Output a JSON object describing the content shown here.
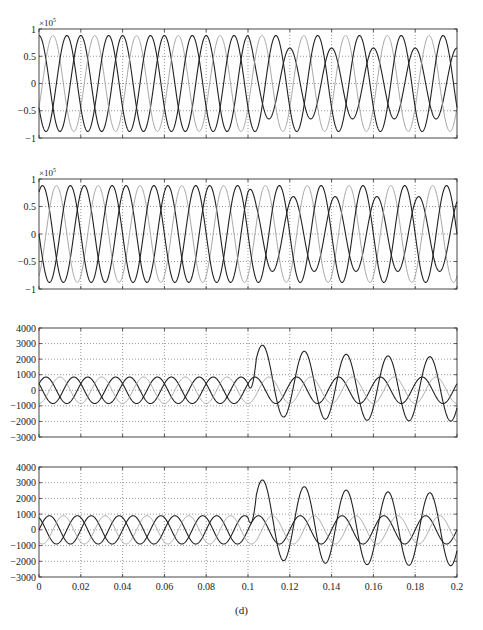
{
  "figure": {
    "caption": "(d)"
  },
  "chart_data": [
    {
      "type": "line",
      "panel": 1,
      "title": "",
      "xlabel": "",
      "ylabel": "",
      "y_multiplier": "×10^5",
      "xlim": [
        0,
        0.2
      ],
      "ylim": [
        -1,
        1
      ],
      "yticks": [
        -1,
        -0.5,
        0,
        0.5,
        1
      ],
      "ytick_labels": [
        "-1",
        "-0.5",
        "0",
        "0.5",
        "1"
      ],
      "xticks": [
        0,
        0.02,
        0.04,
        0.06,
        0.08,
        0.1,
        0.12,
        0.14,
        0.16,
        0.18,
        0.2
      ],
      "xtick_labels_shown": false,
      "grid": true,
      "description": "Three-phase sinusoidal voltages (50 Hz), amplitude ~0.88e5; after t=0.1 the dark phase amplitude drops to ~0.65e5 (fault)",
      "series": [
        {
          "name": "phase A",
          "amplitude_pre": 0.88,
          "amplitude_post": 0.65,
          "phase_deg": 90,
          "style": "dark"
        },
        {
          "name": "phase B",
          "amplitude_pre": 0.88,
          "amplitude_post": 0.88,
          "phase_deg": -30,
          "style": "gray"
        },
        {
          "name": "phase C",
          "amplitude_pre": 0.88,
          "amplitude_post": 0.88,
          "phase_deg": 210,
          "style": "dark"
        }
      ],
      "frequency_hz": 50,
      "event_time": 0.1
    },
    {
      "type": "line",
      "panel": 2,
      "title": "",
      "xlabel": "",
      "ylabel": "",
      "y_multiplier": "×10^5",
      "xlim": [
        0,
        0.2
      ],
      "ylim": [
        -1,
        1
      ],
      "yticks": [
        -1,
        -0.5,
        0,
        0.5,
        1
      ],
      "ytick_labels": [
        "-1",
        "-0.5",
        "0",
        "0.5",
        "1"
      ],
      "xticks": [
        0,
        0.02,
        0.04,
        0.06,
        0.08,
        0.1,
        0.12,
        0.14,
        0.16,
        0.18,
        0.2
      ],
      "xtick_labels_shown": false,
      "grid": true,
      "description": "Three-phase sinusoidal voltages (50 Hz), amplitude ~0.88e5; after t=0.1 the dark phase amplitude drops to ~0.68e5",
      "series": [
        {
          "name": "phase A",
          "amplitude_pre": 0.88,
          "amplitude_post": 0.68,
          "phase_deg": 60,
          "style": "dark"
        },
        {
          "name": "phase B",
          "amplitude_pre": 0.88,
          "amplitude_post": 0.88,
          "phase_deg": -60,
          "style": "gray"
        },
        {
          "name": "phase C",
          "amplitude_pre": 0.88,
          "amplitude_post": 0.88,
          "phase_deg": 180,
          "style": "dark"
        }
      ],
      "frequency_hz": 50,
      "event_time": 0.1
    },
    {
      "type": "line",
      "panel": 3,
      "title": "",
      "xlabel": "",
      "ylabel": "",
      "xlim": [
        0,
        0.2
      ],
      "ylim": [
        -3000,
        4000
      ],
      "yticks": [
        -3000,
        -2000,
        -1000,
        0,
        1000,
        2000,
        3000,
        4000
      ],
      "ytick_labels": [
        "-3000",
        "-2000",
        "-1000",
        "0",
        "1000",
        "2000",
        "3000",
        "4000"
      ],
      "xticks": [
        0,
        0.02,
        0.04,
        0.06,
        0.08,
        0.1,
        0.12,
        0.14,
        0.16,
        0.18,
        0.2
      ],
      "xtick_labels_shown": false,
      "grid": true,
      "description": "Three-phase currents amplitude ~850; after t=0.1 the faulted phase rises with DC offset: peaks ~3100, 2400, 2200, 2100, 2100; troughs ~-1500, -1900, -2000, -2000",
      "series": [
        {
          "name": "phase A (faulted)",
          "amplitude_pre": 850,
          "phase_deg": 150,
          "style": "dark",
          "post_peaks": [
            [
              0.107,
              3100
            ],
            [
              0.127,
              2400
            ],
            [
              0.147,
              2200
            ],
            [
              0.167,
              2150
            ],
            [
              0.187,
              2100
            ]
          ],
          "post_troughs": [
            [
              0.117,
              -1500
            ],
            [
              0.137,
              -1900
            ],
            [
              0.157,
              -2000
            ],
            [
              0.177,
              -2000
            ],
            [
              0.197,
              -2000
            ]
          ]
        },
        {
          "name": "phase B",
          "amplitude_pre": 850,
          "phase_deg": 30,
          "style": "dark"
        },
        {
          "name": "phase C",
          "amplitude_pre": 850,
          "phase_deg": -90,
          "style": "gray"
        }
      ],
      "frequency_hz": 50,
      "event_time": 0.1
    },
    {
      "type": "line",
      "panel": 4,
      "title": "",
      "xlabel": "",
      "ylabel": "",
      "xlim": [
        0,
        0.2
      ],
      "ylim": [
        -3000,
        4000
      ],
      "yticks": [
        -3000,
        -2000,
        -1000,
        0,
        1000,
        2000,
        3000,
        4000
      ],
      "ytick_labels": [
        "-3000",
        "-2000",
        "-1000",
        "0",
        "1000",
        "2000",
        "3000",
        "4000"
      ],
      "xticks": [
        0,
        0.02,
        0.04,
        0.06,
        0.08,
        0.1,
        0.12,
        0.14,
        0.16,
        0.18,
        0.2
      ],
      "xtick_labels": [
        "0",
        "0.02",
        "0.04",
        "0.06",
        "0.08",
        "0.1",
        "0.12",
        "0.14",
        "0.16",
        "0.18",
        "0.2"
      ],
      "xtick_labels_shown": true,
      "grid": true,
      "description": "Three-phase currents amplitude ~900; after t=0.1 the faulted phase peaks ~3400, 2600, 2400, 2300, 2300; troughs ~-1700, -2100, -2200, -2300",
      "series": [
        {
          "name": "phase A (faulted)",
          "amplitude_pre": 900,
          "phase_deg": 120,
          "style": "dark",
          "post_peaks": [
            [
              0.107,
              3400
            ],
            [
              0.127,
              2600
            ],
            [
              0.147,
              2400
            ],
            [
              0.167,
              2300
            ],
            [
              0.187,
              2300
            ]
          ],
          "post_troughs": [
            [
              0.117,
              -1700
            ],
            [
              0.137,
              -2100
            ],
            [
              0.157,
              -2200
            ],
            [
              0.177,
              -2300
            ],
            [
              0.197,
              -2300
            ]
          ]
        },
        {
          "name": "phase B",
          "amplitude_pre": 900,
          "phase_deg": 0,
          "style": "dark"
        },
        {
          "name": "phase C",
          "amplitude_pre": 900,
          "phase_deg": -120,
          "style": "gray"
        }
      ],
      "frequency_hz": 50,
      "event_time": 0.1
    }
  ],
  "layout": {
    "plot_left": 39,
    "plot_right": 457,
    "panels_y": [
      [
        29,
        138
      ],
      [
        179,
        289
      ],
      [
        328,
        437
      ],
      [
        467,
        577
      ]
    ],
    "colors": {
      "dark": "#222222",
      "gray": "#9a9a9a",
      "grid": "#555555",
      "axis": "#333333"
    }
  }
}
